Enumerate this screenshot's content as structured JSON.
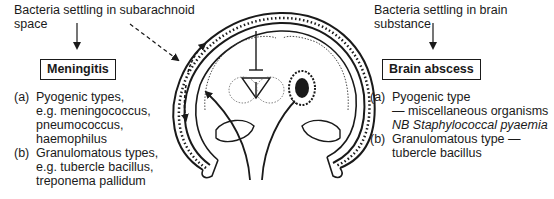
{
  "left": {
    "caption_line1": "Bacteria settling in subarachnoid",
    "caption_line2": "space",
    "box_label": "Meningitis",
    "items": [
      {
        "label": "(a)",
        "lines": [
          "Pyogenic types,",
          "e.g. meningococcus,",
          "pneumococcus,",
          "haemophilus"
        ]
      },
      {
        "label": "(b)",
        "lines": [
          "Granulomatous types,",
          "e.g. tubercle bacillus,",
          "treponema pallidum"
        ]
      }
    ]
  },
  "right": {
    "caption_line1": "Bacteria settling in brain",
    "caption_line2": "substance",
    "box_label": "Brain abscess",
    "items": [
      {
        "label": "(a)",
        "lines": [
          "Pyogenic type",
          "— miscellaneous organisms",
          "NB Staphylococcal pyaemia"
        ]
      },
      {
        "label": "(b)",
        "lines": [
          "Granulomatous type —",
          "tubercle bacillus"
        ]
      }
    ]
  }
}
